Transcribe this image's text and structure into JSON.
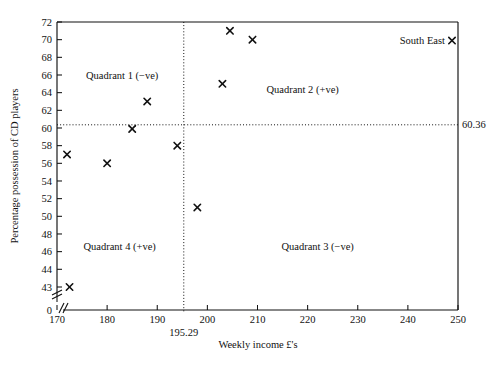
{
  "chart_data": {
    "type": "scatter",
    "title": "",
    "xlabel": "Weekly income £'s",
    "ylabel": "Percentage possession of CD players",
    "xlim": [
      170,
      250
    ],
    "ylim": [
      43,
      72
    ],
    "grid": false,
    "legend": "none",
    "xticks": [
      170,
      180,
      190,
      200,
      210,
      220,
      230,
      240,
      250
    ],
    "yticks": [
      43,
      44,
      46,
      48,
      50,
      52,
      54,
      56,
      58,
      60,
      62,
      64,
      66,
      68,
      70,
      72
    ],
    "y_axis_break": true,
    "y_origin_label": "0",
    "points": [
      {
        "x": 172.0,
        "y": 57.0,
        "label": ""
      },
      {
        "x": 172.5,
        "y": 43.0,
        "label": ""
      },
      {
        "x": 180.0,
        "y": 56.0,
        "label": ""
      },
      {
        "x": 185.0,
        "y": 59.9,
        "label": ""
      },
      {
        "x": 188.0,
        "y": 63.0,
        "label": ""
      },
      {
        "x": 194.0,
        "y": 58.0,
        "label": ""
      },
      {
        "x": 198.0,
        "y": 51.0,
        "label": ""
      },
      {
        "x": 203.0,
        "y": 65.0,
        "label": ""
      },
      {
        "x": 204.5,
        "y": 71.0,
        "label": ""
      },
      {
        "x": 209.0,
        "y": 70.0,
        "label": ""
      },
      {
        "x": 248.8,
        "y": 69.9,
        "label": "South East"
      }
    ],
    "reference_lines": {
      "horizontal": {
        "value": 60.36,
        "label": "60.36",
        "style": "dotted"
      },
      "vertical": {
        "value": 195.29,
        "label": "195.29",
        "style": "dotted"
      }
    },
    "annotations": [
      {
        "text": "Quadrant 1 (−ve)",
        "x": 183.0,
        "y": 65.6
      },
      {
        "text": "Quadrant 2 (+ve)",
        "x": 219.0,
        "y": 64.0
      },
      {
        "text": "Quadrant 4 (+ve)",
        "x": 182.5,
        "y": 46.2
      },
      {
        "text": "Quadrant 3 (−ve)",
        "x": 222.0,
        "y": 46.2
      }
    ]
  },
  "axis": {
    "x_title": "Weekly income £'s",
    "y_title": "Percentage possession of CD players"
  }
}
